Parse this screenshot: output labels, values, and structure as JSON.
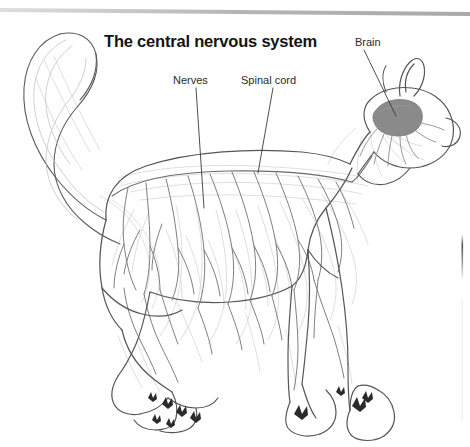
{
  "figure": {
    "title": "The central nervous system",
    "style": "scanned line-art anatomical illustration",
    "background_color": "#ffffff",
    "line_color": "#555555",
    "faint_line_color": "#c9c9c9",
    "brain_fill_color": "#8a8a8a",
    "claw_color": "#2a2a2a",
    "leader_line_color": "#3a3a3a"
  },
  "labels": [
    {
      "id": "nerves",
      "text": "Nerves"
    },
    {
      "id": "spinal_cord",
      "text": "Spinal cord"
    },
    {
      "id": "brain",
      "text": "Brain"
    }
  ],
  "artifacts": {
    "top_rule": "page-edge-rule",
    "right_rule": "page-edge-mark"
  }
}
